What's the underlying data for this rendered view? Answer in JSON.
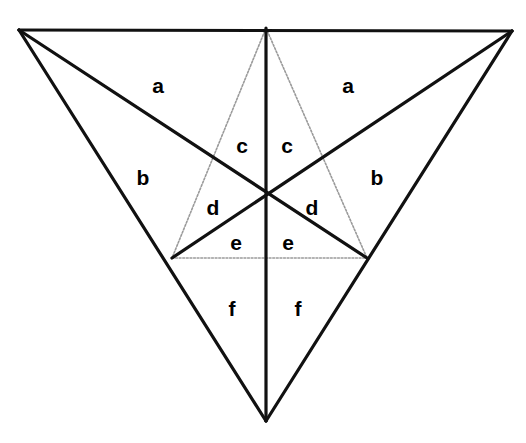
{
  "figure": {
    "width": 526,
    "height": 443,
    "background_color": "#ffffff",
    "stroke_color_main": "#111111",
    "stroke_color_inner": "#9a9a9a",
    "main_stroke_width": 3.2,
    "inner_stroke_width": 1.6,
    "inner_dash_pattern": "1.8 1.8"
  },
  "vertices": {
    "top_left": {
      "name": "A",
      "x": 19,
      "y": 30
    },
    "top_right": {
      "name": "B",
      "x": 512,
      "y": 31
    },
    "bottom": {
      "name": "C",
      "x": 266,
      "y": 421
    },
    "top_mid": {
      "name": "M_AB",
      "x": 266,
      "y": 28
    },
    "left_mid": {
      "name": "M_AC",
      "x": 172,
      "y": 258
    },
    "right_mid": {
      "name": "M_BC",
      "x": 367,
      "y": 258
    },
    "centroid": {
      "name": "G",
      "x": 266,
      "y": 192
    }
  },
  "outer_edges": [
    {
      "name": "top-edge",
      "from": "top_left",
      "to": "top_right",
      "x1": 19,
      "y1": 30,
      "x2": 512,
      "y2": 31
    },
    {
      "name": "left-edge",
      "from": "top_left",
      "to": "bottom",
      "x1": 19,
      "y1": 30,
      "x2": 266,
      "y2": 421
    },
    {
      "name": "right-edge",
      "from": "top_right",
      "to": "bottom",
      "x1": 512,
      "y1": 31,
      "x2": 266,
      "y2": 421
    }
  ],
  "cevians": [
    {
      "name": "median-from-bottom-vertex",
      "x1": 266,
      "y1": 421,
      "x2": 266,
      "y2": 28
    },
    {
      "name": "median-from-top-left-vertex",
      "x1": 19,
      "y1": 30,
      "x2": 367,
      "y2": 258
    },
    {
      "name": "median-from-top-right-vertex",
      "x1": 512,
      "y1": 31,
      "x2": 172,
      "y2": 258
    }
  ],
  "inner_triangle_edges": [
    {
      "name": "inner-left-edge",
      "x1": 266,
      "y1": 28,
      "x2": 172,
      "y2": 258
    },
    {
      "name": "inner-right-edge",
      "x1": 266,
      "y1": 28,
      "x2": 367,
      "y2": 258
    },
    {
      "name": "inner-base-edge",
      "x1": 172,
      "y1": 258,
      "x2": 367,
      "y2": 258
    }
  ],
  "labels": [
    {
      "id": "a-left",
      "text": "a",
      "x": 158,
      "y": 85
    },
    {
      "id": "a-right",
      "text": "a",
      "x": 348,
      "y": 85
    },
    {
      "id": "c-left",
      "text": "c",
      "x": 242,
      "y": 145
    },
    {
      "id": "c-right",
      "text": "c",
      "x": 287,
      "y": 145
    },
    {
      "id": "b-left",
      "text": "b",
      "x": 143,
      "y": 177
    },
    {
      "id": "b-right",
      "text": "b",
      "x": 377,
      "y": 177
    },
    {
      "id": "d-left",
      "text": "d",
      "x": 213,
      "y": 207
    },
    {
      "id": "d-right",
      "text": "d",
      "x": 312,
      "y": 207
    },
    {
      "id": "e-left",
      "text": "e",
      "x": 236,
      "y": 242
    },
    {
      "id": "e-right",
      "text": "e",
      "x": 288,
      "y": 242
    },
    {
      "id": "f-left",
      "text": "f",
      "x": 232,
      "y": 308
    },
    {
      "id": "f-right",
      "text": "f",
      "x": 298,
      "y": 308
    }
  ],
  "chart_data": {
    "type": "diagram",
    "region_labels": [
      "a",
      "a",
      "b",
      "b",
      "c",
      "c",
      "d",
      "d",
      "e",
      "e",
      "f",
      "f"
    ],
    "distinct_labels": [
      "a",
      "b",
      "c",
      "d",
      "e",
      "f"
    ],
    "regions_per_label": 2,
    "total_regions": 12
  }
}
